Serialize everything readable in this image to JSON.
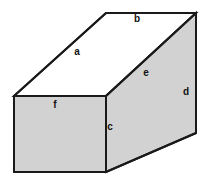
{
  "figure": {
    "name": "rectangular-prism-diagram",
    "background_color": "#ffffff",
    "stroke_color": "#1a1a1a",
    "stroke_width": 2,
    "shaded_fill": "#d2d2d2",
    "unshaded_fill": "#ffffff",
    "canvas": {
      "width": 209,
      "height": 181
    }
  },
  "geometry": {
    "vertices": {
      "front_top_left": {
        "x": 14,
        "y": 96
      },
      "front_top_right": {
        "x": 106,
        "y": 96
      },
      "front_bottom_right": {
        "x": 106,
        "y": 172
      },
      "front_bottom_left": {
        "x": 14,
        "y": 172
      },
      "back_top_left": {
        "x": 106,
        "y": 13
      },
      "back_top_right": {
        "x": 196,
        "y": 13
      },
      "back_bottom_right": {
        "x": 196,
        "y": 133
      }
    },
    "faces": [
      {
        "id": "front-face",
        "label": "f",
        "shaded": true,
        "points": "14,96 106,96 106,172 14,172"
      },
      {
        "id": "top-face",
        "label": "a",
        "shaded": false,
        "points": "14,96 106,13 196,13 106,96"
      },
      {
        "id": "side-face",
        "label": "e",
        "shaded": true,
        "points": "106,96 196,13 196,133 106,172"
      }
    ],
    "edges": [
      {
        "id": "edge-a",
        "label": "a",
        "from": "front_top_left",
        "to": "back_top_left"
      },
      {
        "id": "edge-b",
        "label": "b",
        "from": "back_top_left",
        "to": "back_top_right"
      },
      {
        "id": "edge-c",
        "label": "c",
        "from": "front_top_right",
        "to": "front_bottom_right"
      },
      {
        "id": "edge-d",
        "label": "d",
        "from": "back_top_right",
        "to": "back_bottom_right"
      },
      {
        "id": "edge-e",
        "label": "e",
        "from": "front_top_right",
        "to": "back_top_right"
      }
    ]
  },
  "labels": [
    {
      "id": "label-a",
      "name": "face-label-a",
      "text": "a",
      "x": 77,
      "y": 52
    },
    {
      "id": "label-b",
      "name": "face-label-b",
      "text": "b",
      "x": 137,
      "y": 19
    },
    {
      "id": "label-c",
      "name": "face-label-c",
      "text": "c",
      "x": 110,
      "y": 127
    },
    {
      "id": "label-d",
      "name": "face-label-d",
      "text": "d",
      "x": 186,
      "y": 92
    },
    {
      "id": "label-e",
      "name": "face-label-e",
      "text": "e",
      "x": 146,
      "y": 73
    },
    {
      "id": "label-f",
      "name": "face-label-f",
      "text": "f",
      "x": 55,
      "y": 105
    }
  ]
}
